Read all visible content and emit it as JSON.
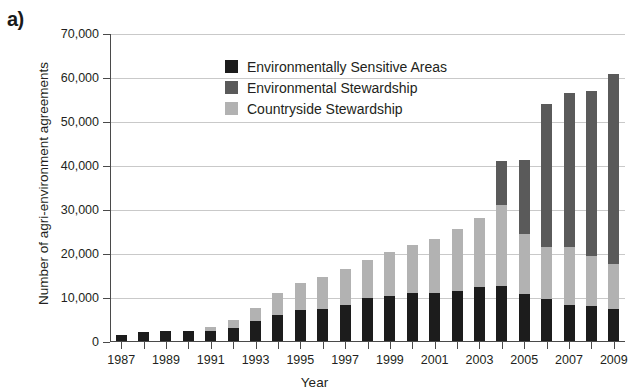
{
  "figure": {
    "panel_label": "a)"
  },
  "chart_data": {
    "type": "bar",
    "subtype": "stacked-vertical",
    "title": "",
    "xlabel": "Year",
    "ylabel": "Number of agri-environment agreements",
    "ylim": [
      0,
      70000
    ],
    "ytick_labels": [
      "0",
      "10,000",
      "20,000",
      "30,000",
      "40,000",
      "50,000",
      "60,000",
      "70,000"
    ],
    "ytick_values": [
      0,
      10000,
      20000,
      30000,
      40000,
      50000,
      60000,
      70000
    ],
    "grid": "horizontal",
    "legend_position": "upper-left-inside",
    "categories": [
      1987,
      1988,
      1989,
      1990,
      1991,
      1992,
      1993,
      1994,
      1995,
      1996,
      1997,
      1998,
      1999,
      2000,
      2001,
      2002,
      2003,
      2004,
      2005,
      2006,
      2007,
      2008,
      2009
    ],
    "xtick_labels": [
      "1987",
      "",
      "1989",
      "",
      "1991",
      "",
      "1993",
      "",
      "1995",
      "",
      "1997",
      "",
      "1999",
      "",
      "2001",
      "",
      "2003",
      "",
      "2005",
      "",
      "2007",
      "",
      "2009"
    ],
    "series": [
      {
        "name": "Environmentally Sensitive Areas",
        "color": "#1c1c1c",
        "values": [
          1500,
          2300,
          2400,
          2600,
          2600,
          3100,
          4700,
          6200,
          7200,
          7400,
          8500,
          9900,
          10400,
          11100,
          11100,
          11700,
          12500,
          12700,
          11000,
          9700,
          8400,
          8100,
          7400
        ]
      },
      {
        "name": "Countryside Stewardship",
        "color": "#b2b2b2",
        "values": [
          0,
          0,
          0,
          0,
          700,
          1900,
          3100,
          5000,
          6300,
          7300,
          8200,
          8700,
          10100,
          11000,
          12300,
          13900,
          15700,
          18500,
          13600,
          12000,
          13300,
          11500,
          10400
        ]
      },
      {
        "name": "Environmental Stewardship",
        "color": "#5a5a5a",
        "values": [
          0,
          0,
          0,
          0,
          0,
          0,
          0,
          0,
          0,
          0,
          0,
          0,
          0,
          0,
          0,
          0,
          0,
          10000,
          16800,
          32300,
          34800,
          37500,
          43200
        ]
      }
    ],
    "stack_order": [
      "Environmentally Sensitive Areas",
      "Countryside Stewardship",
      "Environmental Stewardship"
    ],
    "totals": [
      1500,
      2300,
      2400,
      2600,
      3300,
      5000,
      7800,
      11200,
      13500,
      14700,
      16700,
      18600,
      20500,
      22100,
      23400,
      25600,
      28200,
      41200,
      41400,
      54000,
      56500,
      57100,
      61000
    ]
  },
  "legend": [
    {
      "label": "Environmentally Sensitive Areas",
      "color": "#1c1c1c"
    },
    {
      "label": "Environmental Stewardship",
      "color": "#5a5a5a"
    },
    {
      "label": "Countryside Stewardship",
      "color": "#b2b2b2"
    }
  ]
}
